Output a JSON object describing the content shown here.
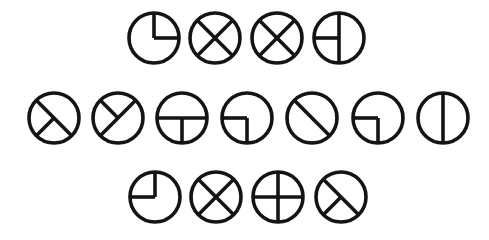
{
  "figure": {
    "background": "#ffffff",
    "ink": "#141414",
    "radius": 25,
    "rows": [
      {
        "y": 38,
        "glyphs": [
          {
            "x": 154,
            "name": "circle-quarter-upper-right",
            "segments": [
              "N-C",
              "C-E"
            ]
          },
          {
            "x": 215,
            "name": "circle-x-cross",
            "segments": [
              "NW-SE",
              "NE-SW"
            ]
          },
          {
            "x": 277,
            "name": "circle-x-cross",
            "segments": [
              "NW-SE",
              "NE-SW"
            ]
          },
          {
            "x": 339,
            "name": "circle-vertical-with-left-half-bar",
            "segments": [
              "N-S",
              "W-C"
            ]
          }
        ]
      },
      {
        "y": 118,
        "glyphs": [
          {
            "x": 54,
            "name": "circle-diagonal-with-lower-left-spoke",
            "segments": [
              "NW-SE",
              "C-SW"
            ]
          },
          {
            "x": 118,
            "name": "circle-diagonal-with-upper-left-spoke",
            "segments": [
              "SW-NE",
              "C-NW"
            ]
          },
          {
            "x": 182,
            "name": "circle-horizontal-with-lower-spoke",
            "segments": [
              "W-E",
              "C-S"
            ]
          },
          {
            "x": 247,
            "name": "circle-quarter-lower-left",
            "segments": [
              "W-C",
              "C-S"
            ]
          },
          {
            "x": 312,
            "name": "circle-single-diagonal",
            "segments": [
              "NW-SE"
            ]
          },
          {
            "x": 378,
            "name": "circle-quarter-lower-left",
            "segments": [
              "W-C",
              "C-S"
            ]
          },
          {
            "x": 443,
            "name": "circle-vertical-line",
            "segments": [
              "N-S"
            ]
          }
        ]
      },
      {
        "y": 197,
        "glyphs": [
          {
            "x": 155,
            "name": "circle-quarter-upper-left",
            "segments": [
              "N-C",
              "W-C"
            ]
          },
          {
            "x": 216,
            "name": "circle-x-cross",
            "segments": [
              "NW-SE",
              "NE-SW"
            ]
          },
          {
            "x": 278,
            "name": "circle-plus-cross",
            "segments": [
              "N-S",
              "W-E"
            ]
          },
          {
            "x": 341,
            "name": "circle-diagonal-with-lower-left-spoke",
            "segments": [
              "NW-SE",
              "C-SW"
            ]
          }
        ]
      }
    ]
  }
}
